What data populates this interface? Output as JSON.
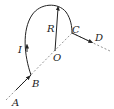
{
  "diagram": {
    "type": "physics-current-loop",
    "labels": {
      "A": "A",
      "B": "B",
      "C": "C",
      "D": "D",
      "O": "O",
      "I": "I",
      "R": "R"
    },
    "colors": {
      "line": "#333333",
      "dashed": "#777777",
      "background": "#ffffff"
    }
  }
}
